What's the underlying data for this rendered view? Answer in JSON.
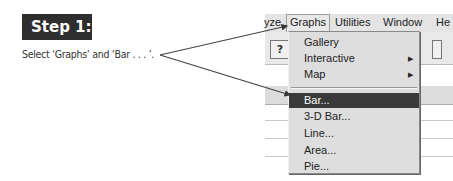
{
  "step": {
    "label": "Step 1:"
  },
  "instruction": "Select ‘Graphs’ and ‘Bar . . . ’.",
  "menubar": {
    "items": [
      {
        "label": "yze"
      },
      {
        "label": "Graphs"
      },
      {
        "label": "Utilities"
      },
      {
        "label": "Window"
      },
      {
        "label": "He"
      }
    ]
  },
  "toolbar": {
    "help_icon": "?"
  },
  "dropdown": {
    "items": [
      {
        "label": "Gallery"
      },
      {
        "label": "Interactive",
        "submenu": "▶"
      },
      {
        "label": "Map",
        "submenu": "▶"
      },
      {
        "label": "Bar..."
      },
      {
        "label": "3-D Bar..."
      },
      {
        "label": "Line..."
      },
      {
        "label": "Area..."
      },
      {
        "label": "Pie..."
      }
    ]
  },
  "colors": {
    "highlight": "#3a3a3a",
    "menu_bg": "#dedede",
    "step_bg": "#2e2e2e"
  }
}
